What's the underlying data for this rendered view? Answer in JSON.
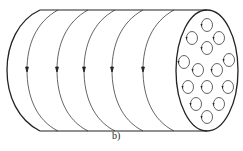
{
  "figure": {
    "caption": "b)",
    "stroke_color": "#222222",
    "loop_count": 5,
    "loops": [
      {
        "x": 27,
        "arrow_y": 70
      },
      {
        "x": 57,
        "arrow_y": 70
      },
      {
        "x": 84,
        "arrow_y": 70
      },
      {
        "x": 112,
        "arrow_y": 70
      },
      {
        "x": 143,
        "arrow_y": 70
      }
    ],
    "end_cells": [
      {
        "cx": 207,
        "cy": 25
      },
      {
        "cx": 192,
        "cy": 38
      },
      {
        "cx": 219,
        "cy": 38
      },
      {
        "cx": 207,
        "cy": 48
      },
      {
        "cx": 184,
        "cy": 62
      },
      {
        "cx": 229,
        "cy": 60
      },
      {
        "cx": 198,
        "cy": 70
      },
      {
        "cx": 217,
        "cy": 70
      },
      {
        "cx": 188,
        "cy": 87
      },
      {
        "cx": 207,
        "cy": 87
      },
      {
        "cx": 228,
        "cy": 87
      },
      {
        "cx": 196,
        "cy": 104
      },
      {
        "cx": 219,
        "cy": 104
      },
      {
        "cx": 207,
        "cy": 117
      }
    ]
  }
}
